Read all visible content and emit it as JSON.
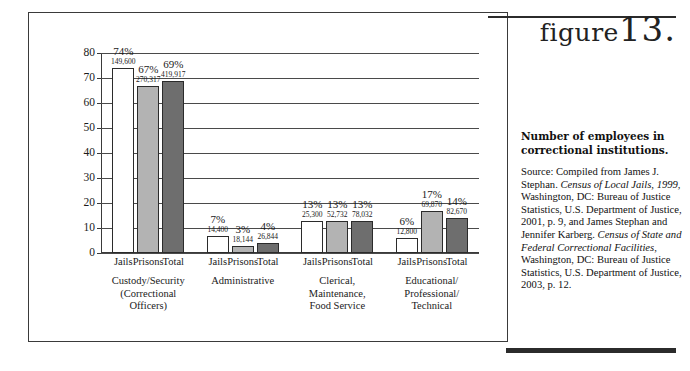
{
  "figure": {
    "word": "figure",
    "number": "13."
  },
  "sidebar": {
    "title": "Number of employees in correctional institutions.",
    "source_label": "Source:",
    "source_text": "Source: Compiled from James J. Stephan. Census of Local Jails, 1999, Washington, DC: Bureau of Justice Statistics, U.S. Department of Justice, 2001, p. 9, and James Stephan and Jennifer Karberg. Census of State and Federal Correctional Facilities, Washington, DC: Bureau of Justice Statistics, U.S. Department of Justice, 2003, p. 12.",
    "source_parts": {
      "p1": "Source: Compiled from James J. Stephan. ",
      "i1": "Census of Local Jails, 1999",
      "p2": ", Washington, DC: Bureau of Justice Statistics, U.S. Department of Justice, 2001, p. 9, and James Stephan and Jennifer Karberg. ",
      "i2": "Census of State and Federal Correctional Facilities",
      "p3": ", Washington, DC: Bureau of Justice Statistics, U.S. Department of Justice, 2003, p. 12."
    }
  },
  "chart_data": {
    "type": "bar",
    "title": "Number of employees in correctional institutions.",
    "xlabel": "",
    "ylabel": "",
    "ylim": [
      0,
      80
    ],
    "yticks": [
      0,
      10,
      20,
      30,
      40,
      50,
      60,
      70,
      80
    ],
    "grid": true,
    "legend_position": "none",
    "series_names": [
      "Jails",
      "Prisons",
      "Total"
    ],
    "series_colors": [
      "#ffffff",
      "#b3b3b3",
      "#6e6e6e"
    ],
    "categories": [
      "Custody/Security\n(Correctional\nOfficers)",
      "Administrative",
      "Clerical,\nMaintenance,\nFood Service",
      "Educational/\nProfessional/\nTechnical"
    ],
    "groups": [
      {
        "label": "Custody/Security\n(Correctional\nOfficers)",
        "bars": [
          {
            "series": "Jails",
            "percent": 74,
            "percent_label": "74%",
            "count_label": "149,600",
            "count": 149600
          },
          {
            "series": "Prisons",
            "percent": 67,
            "percent_label": "67%",
            "count_label": "270,317",
            "count": 270317
          },
          {
            "series": "Total",
            "percent": 69,
            "percent_label": "69%",
            "count_label": "419,917",
            "count": 419917
          }
        ]
      },
      {
        "label": "Administrative",
        "bars": [
          {
            "series": "Jails",
            "percent": 7,
            "percent_label": "7%",
            "count_label": "14,400",
            "count": 14400
          },
          {
            "series": "Prisons",
            "percent": 3,
            "percent_label": "3%",
            "count_label": "18,144",
            "count": 18144
          },
          {
            "series": "Total",
            "percent": 4,
            "percent_label": "4%",
            "count_label": "26,844",
            "count": 26844
          }
        ]
      },
      {
        "label": "Clerical,\nMaintenance,\nFood Service",
        "bars": [
          {
            "series": "Jails",
            "percent": 13,
            "percent_label": "13%",
            "count_label": "25,300",
            "count": 25300
          },
          {
            "series": "Prisons",
            "percent": 13,
            "percent_label": "13%",
            "count_label": "52,732",
            "count": 52732
          },
          {
            "series": "Total",
            "percent": 13,
            "percent_label": "13%",
            "count_label": "78,032",
            "count": 78032
          }
        ]
      },
      {
        "label": "Educational/\nProfessional/\nTechnical",
        "bars": [
          {
            "series": "Jails",
            "percent": 6,
            "percent_label": "6%",
            "count_label": "12,800",
            "count": 12800
          },
          {
            "series": "Prisons",
            "percent": 17,
            "percent_label": "17%",
            "count_label": "69,870",
            "count": 69870
          },
          {
            "series": "Total",
            "percent": 14,
            "percent_label": "14%",
            "count_label": "82,670",
            "count": 82670
          }
        ]
      }
    ]
  }
}
